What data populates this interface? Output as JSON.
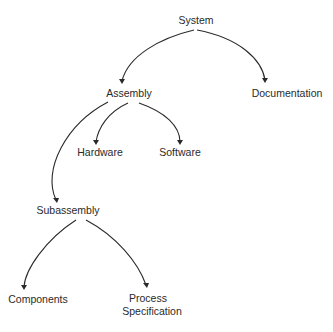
{
  "diagram": {
    "type": "hierarchy-tree",
    "nodes": {
      "system": "System",
      "assembly": "Assembly",
      "documentation": "Documentation",
      "hardware": "Hardware",
      "software": "Software",
      "subassembly": "Subassembly",
      "components": "Components",
      "process_specification_line1": "Process",
      "process_specification_line2": "Specification"
    },
    "edges": [
      {
        "from": "System",
        "to": "Assembly"
      },
      {
        "from": "System",
        "to": "Documentation"
      },
      {
        "from": "Assembly",
        "to": "Hardware"
      },
      {
        "from": "Assembly",
        "to": "Software"
      },
      {
        "from": "Assembly",
        "to": "Subassembly"
      },
      {
        "from": "Subassembly",
        "to": "Components"
      },
      {
        "from": "Subassembly",
        "to": "Process Specification"
      }
    ]
  }
}
